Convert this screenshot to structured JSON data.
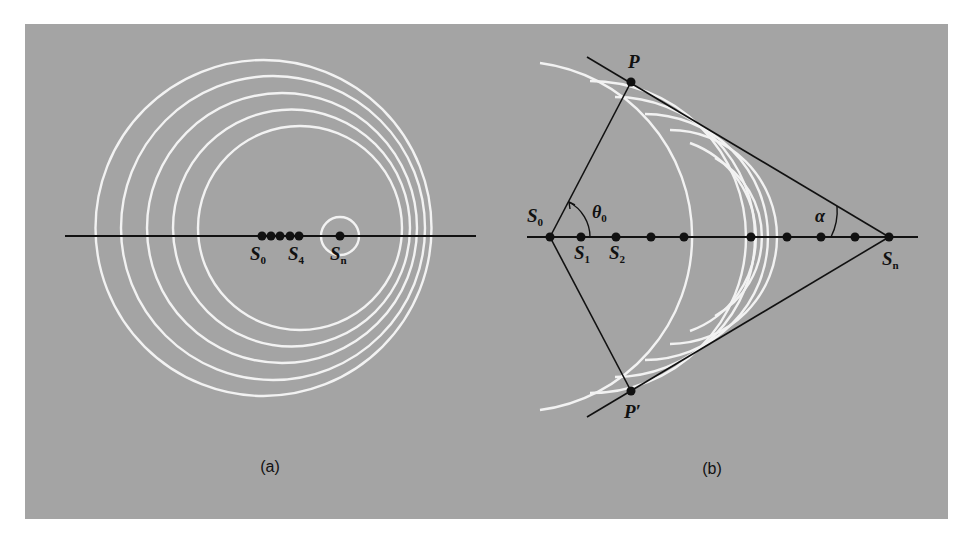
{
  "figure": {
    "background": "#a4a4a4",
    "wavefront_color": "#f2f2f2",
    "line_color": "#111111",
    "panels": [
      {
        "id": "a",
        "caption": "(a)",
        "description": "Source moving slower than wave speed: nested non-concentric circular wavefronts",
        "labels": [
          {
            "text": "S",
            "sub": "0"
          },
          {
            "text": "S",
            "sub": "4"
          },
          {
            "text": "S",
            "sub": "n"
          }
        ]
      },
      {
        "id": "b",
        "caption": "(b)",
        "description": "Source moving faster than wave speed: wavefronts bounded by a shock cone",
        "labels": [
          {
            "text": "P",
            "sub": ""
          },
          {
            "text": "P′",
            "sub": ""
          },
          {
            "text": "S",
            "sub": "0"
          },
          {
            "text": "S",
            "sub": "1"
          },
          {
            "text": "S",
            "sub": "2"
          },
          {
            "text": "S",
            "sub": "n"
          },
          {
            "text": "θ",
            "sub": "0"
          },
          {
            "text": "α",
            "sub": ""
          }
        ]
      }
    ]
  }
}
